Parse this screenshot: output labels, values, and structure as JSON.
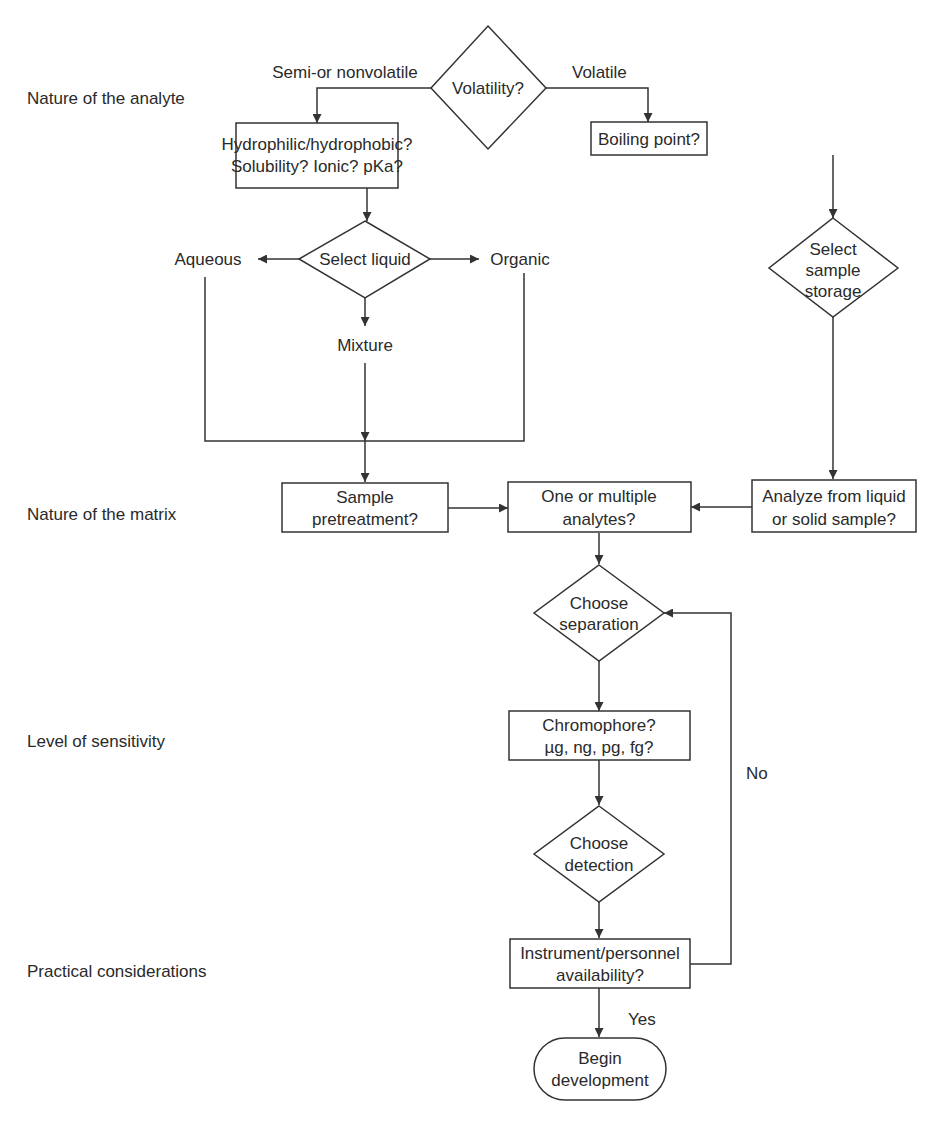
{
  "stage_labels": {
    "analyte": "Nature of the analyte",
    "matrix": "Nature of the matrix",
    "sensitivity": "Level of sensitivity",
    "practical": "Practical considerations"
  },
  "nodes": {
    "volatility": {
      "lines": [
        "Volatility?"
      ]
    },
    "hydrophilic": {
      "lines": [
        "Hydrophilic/hydrophobic?",
        "Solubility? Ionic? pKa?"
      ]
    },
    "boiling": {
      "lines": [
        "Boiling point?"
      ]
    },
    "select_liquid": {
      "lines": [
        "Select liquid"
      ]
    },
    "aqueous": {
      "lines": [
        "Aqueous"
      ]
    },
    "organic": {
      "lines": [
        "Organic"
      ]
    },
    "mixture": {
      "lines": [
        "Mixture"
      ]
    },
    "sample_storage": {
      "lines": [
        "Select",
        "sample",
        "storage"
      ]
    },
    "pretreatment": {
      "lines": [
        "Sample",
        "pretreatment?"
      ]
    },
    "analytes": {
      "lines": [
        "One or multiple",
        "analytes?"
      ]
    },
    "analyze_from": {
      "lines": [
        "Analyze from liquid",
        "or solid sample?"
      ]
    },
    "separation": {
      "lines": [
        "Choose",
        "separation"
      ]
    },
    "chromophore": {
      "lines": [
        "Chromophore?",
        "µg, ng, pg, fg?"
      ]
    },
    "detection": {
      "lines": [
        "Choose",
        "detection"
      ]
    },
    "instrument": {
      "lines": [
        "Instrument/personnel",
        "availability?"
      ]
    },
    "begin": {
      "lines": [
        "Begin",
        "development"
      ]
    }
  },
  "edge_labels": {
    "semi_nonvolatile": "Semi-or nonvolatile",
    "volatile": "Volatile",
    "no": "No",
    "yes": "Yes"
  },
  "colors": {
    "stroke": "#333333",
    "text": "#2a2a2a",
    "background": "#ffffff"
  }
}
